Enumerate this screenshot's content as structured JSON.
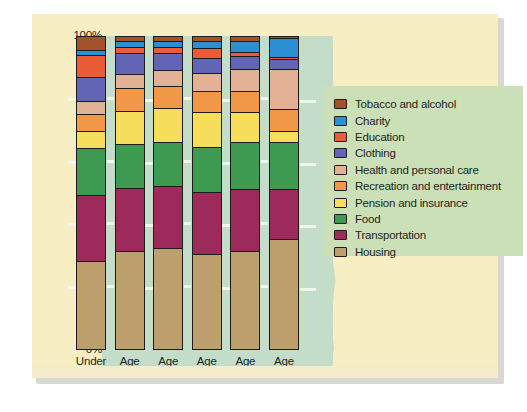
{
  "chart_data": {
    "type": "bar",
    "stacked": true,
    "stacked_mode": "percent",
    "title": "",
    "xlabel": "",
    "ylabel": "",
    "ylim": [
      0,
      100
    ],
    "y_ticks": [
      "0%",
      "20%",
      "40%",
      "60%",
      "80%",
      "100%"
    ],
    "grid": true,
    "legend_position": "right",
    "categories": [
      "Under 25",
      "Age 25-34",
      "Age 35-44",
      "Age 45-54",
      "Age 55-64",
      "Age 65+"
    ],
    "category_lines": [
      [
        "Under",
        "25"
      ],
      [
        "Age",
        "25–34"
      ],
      [
        "Age",
        "35–44"
      ],
      [
        "Age",
        "45–54"
      ],
      [
        "Age",
        "55–64"
      ],
      [
        "Age",
        "65+"
      ]
    ],
    "series": [
      {
        "name": "Housing",
        "color": "#bd9f6e",
        "values": [
          28.0,
          31.0,
          32.0,
          30.0,
          31.0,
          35.0
        ]
      },
      {
        "name": "Transportation",
        "color": "#9c2b5b",
        "values": [
          21.0,
          20.0,
          20.0,
          20.0,
          20.0,
          16.0
        ]
      },
      {
        "name": "Food",
        "color": "#3f9a51",
        "values": [
          15.0,
          14.0,
          14.0,
          14.5,
          15.0,
          15.0
        ]
      },
      {
        "name": "Pension and insurance",
        "color": "#f6dd5c",
        "values": [
          5.5,
          10.5,
          11.0,
          11.0,
          9.5,
          3.5
        ]
      },
      {
        "name": "Recreation and entertainment",
        "color": "#f09848",
        "values": [
          5.5,
          7.5,
          7.0,
          7.0,
          7.0,
          7.0
        ]
      },
      {
        "name": "Health and personal care",
        "color": "#e3b196",
        "values": [
          4.0,
          4.5,
          5.0,
          5.5,
          7.0,
          13.0
        ]
      },
      {
        "name": "Clothing",
        "color": "#6264b4",
        "values": [
          8.0,
          6.5,
          5.5,
          5.0,
          4.0,
          3.0
        ]
      },
      {
        "name": "Education",
        "color": "#ea5b38",
        "values": [
          7.0,
          2.0,
          2.0,
          3.0,
          1.5,
          0.8
        ]
      },
      {
        "name": "Charity",
        "color": "#2b8fd4",
        "values": [
          1.5,
          2.0,
          2.0,
          2.5,
          3.5,
          6.0
        ]
      },
      {
        "name": "Tobacco and alcohol",
        "color": "#a3522c",
        "values": [
          4.5,
          1.5,
          1.5,
          1.5,
          1.5,
          0.7
        ]
      }
    ],
    "legend_order": [
      "Tobacco and alcohol",
      "Charity",
      "Education",
      "Clothing",
      "Health and personal care",
      "Recreation and entertainment",
      "Pension and insurance",
      "Food",
      "Transportation",
      "Housing"
    ]
  },
  "legend": {
    "items": [
      {
        "label": "Tobacco and alcohol",
        "color": "#a3522c"
      },
      {
        "label": "Charity",
        "color": "#2b8fd4"
      },
      {
        "label": "Education",
        "color": "#ea5b38"
      },
      {
        "label": "Clothing",
        "color": "#6264b4"
      },
      {
        "label": "Health and personal care",
        "color": "#e3b196"
      },
      {
        "label": "Recreation and entertainment",
        "color": "#f09848"
      },
      {
        "label": "Pension and insurance",
        "color": "#f6dd5c"
      },
      {
        "label": "Food",
        "color": "#3f9a51"
      },
      {
        "label": "Transportation",
        "color": "#9c2b5b"
      },
      {
        "label": "Housing",
        "color": "#bd9f6e"
      }
    ]
  },
  "colors": {
    "card_background": "#f7eec3",
    "plot_background": "#c3ddc9",
    "legend_background": "#cbe0b6",
    "gridline": "#f4f8f2",
    "outline": "#1b1b1b",
    "text": "#231f20"
  }
}
